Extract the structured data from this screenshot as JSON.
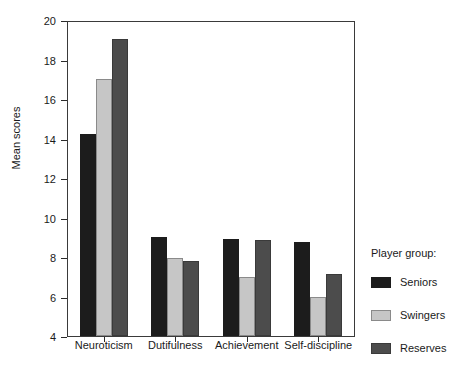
{
  "chart_data": {
    "type": "bar",
    "title": "",
    "xlabel": "",
    "ylabel": "Mean scores",
    "ylim": [
      4,
      20
    ],
    "yticks": [
      4,
      6,
      8,
      10,
      12,
      14,
      16,
      18,
      20
    ],
    "grid": false,
    "legend_position": "right",
    "legend_title": "Player group:",
    "categories": [
      "Neuroticism",
      "Dutifulness",
      "Achievement",
      "Self-discipline"
    ],
    "series": [
      {
        "name": "Seniors",
        "color": "#1c1c1c",
        "values": [
          14.25,
          9.0,
          8.9,
          8.75
        ]
      },
      {
        "name": "Swingers",
        "color": "#c6c6c6",
        "values": [
          17.0,
          7.95,
          7.0,
          6.0
        ]
      },
      {
        "name": "Reserves",
        "color": "#4c4c4c",
        "values": [
          19.05,
          7.8,
          8.85,
          7.15
        ]
      }
    ]
  },
  "axis": {
    "y_label": "Mean scores",
    "y_tick_labels": [
      "20",
      "18",
      "16",
      "14",
      "12",
      "10",
      "8",
      "6",
      "4"
    ],
    "x_tick_labels": [
      "Neuroticism",
      "Dutifulness",
      "Achievement",
      "Self-discipline"
    ]
  },
  "legend": {
    "title": "Player group:",
    "items": [
      {
        "label": "Seniors",
        "color": "#1c1c1c"
      },
      {
        "label": "Swingers",
        "color": "#c6c6c6"
      },
      {
        "label": "Reserves",
        "color": "#4c4c4c"
      }
    ]
  },
  "caption": {
    "text": ""
  }
}
